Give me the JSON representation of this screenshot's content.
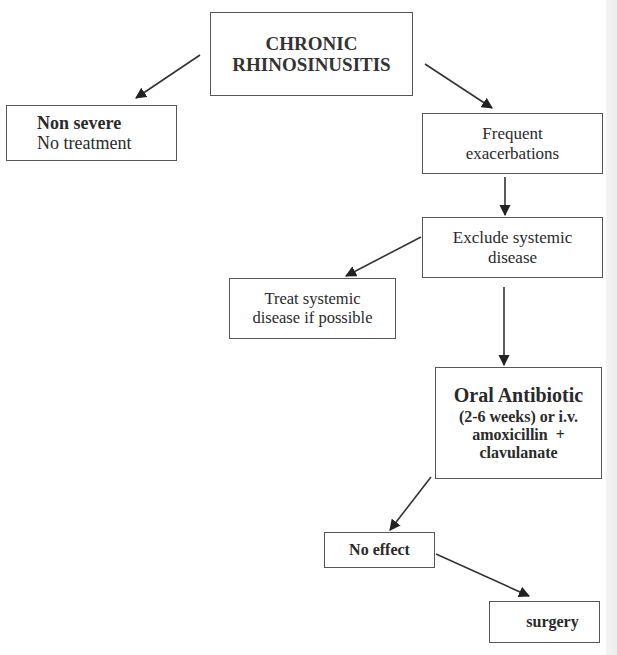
{
  "diagram": {
    "type": "flowchart",
    "nodes": {
      "chronic": {
        "lines": [
          "CHRONIC",
          "RHINOSINUSITIS"
        ]
      },
      "non_severe": {
        "title": "Non severe",
        "subtitle": "No treatment"
      },
      "frequent": {
        "lines": [
          "Frequent",
          "exacerbations"
        ]
      },
      "exclude": {
        "lines": [
          "Exclude systemic",
          "disease"
        ]
      },
      "treat": {
        "lines": [
          "Treat systemic",
          "disease if possible"
        ]
      },
      "oral": {
        "title": "Oral Antibiotic",
        "lines": [
          "(2-6 weeks) or i.v.",
          "amoxicillin  +",
          "clavulanate"
        ]
      },
      "no_effect": {
        "label": "No effect"
      },
      "surgery": {
        "label": "surgery"
      }
    },
    "edges": [
      {
        "from": "chronic",
        "to": "non_severe"
      },
      {
        "from": "chronic",
        "to": "frequent"
      },
      {
        "from": "frequent",
        "to": "exclude"
      },
      {
        "from": "exclude",
        "to": "treat"
      },
      {
        "from": "exclude",
        "to": "oral"
      },
      {
        "from": "oral",
        "to": "no_effect"
      },
      {
        "from": "no_effect",
        "to": "surgery"
      }
    ],
    "colors": {
      "line": "#333333",
      "border": "#555555",
      "background": "#ffffff"
    }
  }
}
